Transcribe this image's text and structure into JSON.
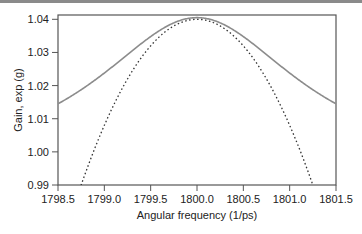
{
  "chart_data": {
    "type": "line",
    "title": "",
    "xlabel": "Angular frequency (1/ps)",
    "ylabel": "Gain, exp (g)",
    "xlim": [
      1798.5,
      1801.5
    ],
    "ylim": [
      0.99,
      1.0413
    ],
    "xticks": [
      "1798.5",
      "1799.0",
      "1799.5",
      "1800.0",
      "1800.5",
      "1801.0",
      "1801.5"
    ],
    "yticks": [
      "0.99",
      "1.00",
      "1.01",
      "1.02",
      "1.03",
      "1.04"
    ],
    "grid": false,
    "legend": null,
    "series": [
      {
        "name": "solid",
        "style": "solid",
        "color": "#8c8c8c",
        "x": [
          1798.5,
          1798.75,
          1799.0,
          1799.25,
          1799.5,
          1799.75,
          1800.0,
          1800.25,
          1800.5,
          1800.75,
          1801.0,
          1801.25,
          1801.5
        ],
        "y": [
          1.0145,
          1.0175,
          1.0215,
          1.0265,
          1.0318,
          1.037,
          1.0405,
          1.037,
          1.0318,
          1.0265,
          1.0215,
          1.0175,
          1.0145
        ]
      },
      {
        "name": "dotted",
        "style": "dotted",
        "color": "#333333",
        "x": [
          1798.75,
          1799.0,
          1799.25,
          1799.5,
          1799.75,
          1800.0,
          1800.25,
          1800.5,
          1800.75,
          1801.0,
          1801.25
        ],
        "y": [
          0.99,
          1.008,
          1.022,
          1.032,
          1.038,
          1.04,
          1.038,
          1.032,
          1.022,
          1.008,
          0.99
        ]
      }
    ]
  },
  "colors": {
    "axis": "#555555",
    "solid_line": "#8c8c8c",
    "dotted_line": "#333333",
    "top_bar": "#8a8a8a"
  }
}
